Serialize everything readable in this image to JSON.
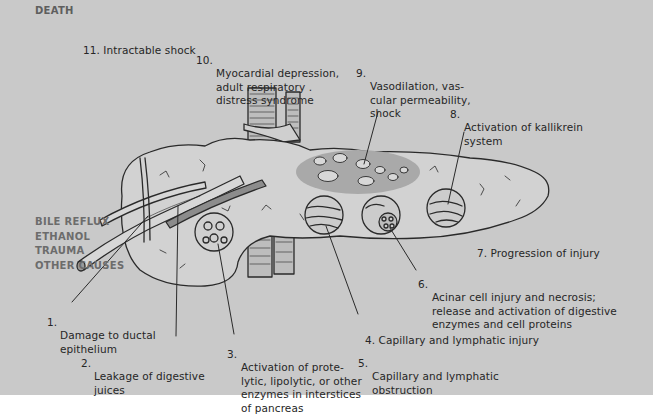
{
  "diagram": {
    "title": "DEATH",
    "causes": [
      "BILE REFLUX",
      "ETHANOL",
      "TRAUMA",
      "OTHER CAUSES"
    ],
    "steps": [
      {
        "num": "1.",
        "text": "Damage to ductal\nepithelium"
      },
      {
        "num": "2.",
        "text": "Leakage of digestive\njuices"
      },
      {
        "num": "3.",
        "text": "Activation of prote-\nlytic, lipolytic, or other\nenzymes in interstices\nof pancreas"
      },
      {
        "num": "4.",
        "text": "Capillary and lymphatic injury"
      },
      {
        "num": "5.",
        "text": "Capillary and lymphatic\nobstruction"
      },
      {
        "num": "6.",
        "text": "Acinar cell injury and necrosis;\nrelease and activation of digestive\nenzymes and cell proteins"
      },
      {
        "num": "7.",
        "text": "Progression of injury"
      },
      {
        "num": "8.",
        "text": "Activation of kallikrein\nsystem"
      },
      {
        "num": "9.",
        "text": "Vasodilation, vas-\ncular permeability,\nshock"
      },
      {
        "num": "10.",
        "text": "Myocardial depression,\nadult respiratory .\ndistress syndrome"
      },
      {
        "num": "11.",
        "text": "Intractable shock"
      }
    ],
    "colors": {
      "background": "#c9c9c9",
      "text": "#262626",
      "cause_text": "#6c6c6c",
      "line": "#2a2a2a"
    }
  }
}
